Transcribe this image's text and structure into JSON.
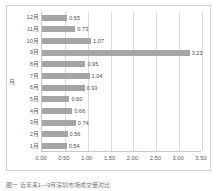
{
  "figure": {
    "caption": "图一  近年来1—9月深圳市场成交量对比"
  },
  "chart_data": {
    "type": "bar",
    "orientation": "horizontal",
    "title": "",
    "xlabel": "",
    "ylabel": "月",
    "categories": [
      "1月",
      "2月",
      "3月",
      "4月",
      "5月",
      "6月",
      "7月",
      "8月",
      "9月",
      "10月",
      "11月",
      "12月"
    ],
    "values": [
      0.54,
      0.56,
      0.74,
      0.66,
      0.6,
      0.93,
      1.04,
      0.95,
      3.23,
      1.07,
      0.73,
      0.55
    ],
    "value_labels": [
      "0.54",
      "0.56",
      "0.74",
      "0.66",
      "0.60",
      "0.93",
      "1.04",
      "0.95",
      "3.23",
      "1.07",
      "0.73",
      "0.55"
    ],
    "xlim": [
      0.0,
      3.5
    ],
    "xticks": [
      0.0,
      0.5,
      1.0,
      1.5,
      2.0,
      2.5,
      3.0,
      3.5
    ],
    "xtick_labels": [
      "0.00",
      "0.50",
      "1.00",
      "1.50",
      "2.00",
      "2.50",
      "3.00",
      "3.50"
    ],
    "grid": "vertical",
    "legend": "none",
    "bar_color": "#a5a5a5",
    "gridline_color": "#dcdcdc",
    "frame_color": "#d0d0d0",
    "category_order": "bottom-to-top"
  }
}
